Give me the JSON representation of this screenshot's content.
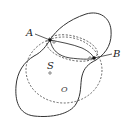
{
  "diagram": {
    "type": "geometry-figure",
    "labels": {
      "point_a": "A",
      "point_b": "B",
      "surface": "S",
      "center": "O"
    },
    "elements": [
      {
        "name": "closed-surface-curve",
        "style": "solid"
      },
      {
        "name": "great-circle",
        "style": "dashed"
      },
      {
        "name": "ellipse-section",
        "style": "dashed"
      },
      {
        "name": "curve-a-to-b",
        "style": "solid"
      },
      {
        "name": "point-a",
        "style": "filled-dot"
      },
      {
        "name": "point-b",
        "style": "filled-dot"
      },
      {
        "name": "center-point",
        "style": "hollow-dot"
      }
    ],
    "colors": {
      "stroke": "#333333",
      "background": "#ffffff"
    }
  }
}
